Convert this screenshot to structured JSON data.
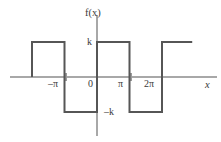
{
  "chart_data": {
    "type": "line",
    "title": "",
    "subtitle": "",
    "xlabel": "x",
    "ylabel": "f(x)",
    "xlim": [
      -6.6,
      7.2
    ],
    "ylim": [
      -1.55,
      1.55
    ],
    "grid": false,
    "legend": null,
    "x_ticks": [
      {
        "value": -3.1416,
        "label": "−π"
      },
      {
        "value": 0,
        "label": "0"
      },
      {
        "value": 3.1416,
        "label": "π"
      },
      {
        "value": 6.2832,
        "label": "2π"
      }
    ],
    "y_ticks": [
      {
        "value": 1,
        "label": "k"
      },
      {
        "value": -1,
        "label": "−k"
      }
    ],
    "series": [
      {
        "name": "f(x)",
        "color": "#565656",
        "points": [
          {
            "x": -6.28,
            "y": 0
          },
          {
            "x": -6.28,
            "y": 1
          },
          {
            "x": -3.14,
            "y": 1
          },
          {
            "x": -3.14,
            "y": -1
          },
          {
            "x": 0,
            "y": -1
          },
          {
            "x": 0,
            "y": 1
          },
          {
            "x": 3.14,
            "y": 1
          },
          {
            "x": 3.14,
            "y": -1
          },
          {
            "x": 6.28,
            "y": -1
          },
          {
            "x": 6.28,
            "y": 1
          },
          {
            "x": 9.2,
            "y": 1
          }
        ]
      }
    ]
  },
  "labels": {
    "y_axis_name": "f(x)",
    "x_axis_name": "x",
    "amplitude_pos": "k",
    "amplitude_neg": "–k",
    "tick_neg_pi": "–π",
    "tick_zero": "0",
    "tick_pi": "π",
    "tick_two_pi": "2π"
  },
  "colors": {
    "wave": "#565656",
    "axis": "#a8a8a8",
    "text": "#3a3a3a",
    "background": "#ffffff"
  }
}
